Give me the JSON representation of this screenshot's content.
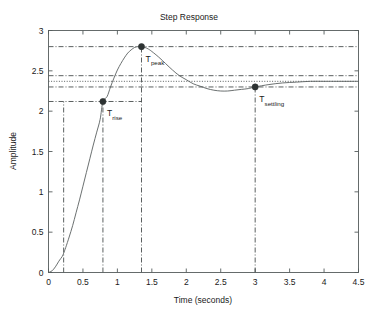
{
  "figure": {
    "title": "Step Response",
    "background": "#ffffff",
    "line_color": "#5a6060",
    "marker_color": "#2d3232",
    "guide_color": "#3c4242"
  },
  "chart_data": {
    "type": "line",
    "title": "Step Response",
    "xlabel": "Time (seconds)",
    "ylabel": "Amplitude",
    "xlim": [
      0,
      4.5
    ],
    "ylim": [
      0,
      3
    ],
    "grid": false,
    "legend": null,
    "xticks": [
      "0",
      "0.5",
      "1",
      "1.5",
      "2",
      "2.5",
      "3",
      "3.5",
      "4",
      "4.5"
    ],
    "xtick_values": [
      0,
      0.5,
      1,
      1.5,
      2,
      2.5,
      3,
      3.5,
      4,
      4.5
    ],
    "yticks": [
      "0",
      "0.5",
      "1",
      "1.5",
      "2",
      "2.5",
      "3"
    ],
    "ytick_values": [
      0,
      0.5,
      1,
      1.5,
      2,
      2.5,
      3
    ],
    "series": [
      {
        "name": "step response",
        "x": [
          0.0,
          0.05,
          0.1,
          0.15,
          0.2,
          0.22,
          0.25,
          0.3,
          0.35,
          0.4,
          0.45,
          0.5,
          0.55,
          0.6,
          0.65,
          0.7,
          0.75,
          0.79,
          0.85,
          0.9,
          0.95,
          1.0,
          1.05,
          1.1,
          1.15,
          1.2,
          1.25,
          1.3,
          1.35,
          1.4,
          1.45,
          1.5,
          1.6,
          1.7,
          1.8,
          1.9,
          2.0,
          2.1,
          2.2,
          2.3,
          2.4,
          2.5,
          2.6,
          2.7,
          2.8,
          2.9,
          3.0,
          3.2,
          3.4,
          3.6,
          3.8,
          4.0,
          4.2,
          4.5
        ],
        "y": [
          0.0,
          0.02,
          0.07,
          0.14,
          0.2,
          0.24,
          0.31,
          0.44,
          0.58,
          0.74,
          0.9,
          1.07,
          1.24,
          1.41,
          1.58,
          1.74,
          1.9,
          2.12,
          2.18,
          2.3,
          2.41,
          2.51,
          2.59,
          2.66,
          2.72,
          2.76,
          2.79,
          2.8,
          2.8,
          2.79,
          2.77,
          2.74,
          2.67,
          2.59,
          2.51,
          2.44,
          2.39,
          2.34,
          2.31,
          2.28,
          2.26,
          2.25,
          2.25,
          2.26,
          2.27,
          2.28,
          2.3,
          2.33,
          2.35,
          2.36,
          2.37,
          2.37,
          2.37,
          2.37
        ]
      }
    ],
    "annotations": [
      {
        "label": "T",
        "subscript": "rise",
        "x": 0.79,
        "y": 2.12,
        "marker": true
      },
      {
        "label": "T",
        "subscript": "peak",
        "x": 1.35,
        "y": 2.8,
        "marker": true
      },
      {
        "label": "T",
        "subscript": "settling",
        "x": 3.0,
        "y": 2.3,
        "marker": true
      }
    ],
    "reference_lines": {
      "vertical": [
        {
          "x": 0.22,
          "style": "dashdot",
          "from_y": 0.0,
          "to_y": 2.12
        },
        {
          "x": 0.79,
          "style": "dashdot",
          "from_y": 0.0,
          "to_y": 2.12
        },
        {
          "x": 1.35,
          "style": "dashdot",
          "from_y": 0.0,
          "to_y": 2.8
        },
        {
          "x": 3.0,
          "style": "dashdot",
          "from_y": 0.0,
          "to_y": 2.3
        }
      ],
      "horizontal": [
        {
          "y": 2.8,
          "style": "dashdot",
          "from_x": 0.0,
          "to_x": 4.5,
          "note": "peak overshoot level"
        },
        {
          "y": 2.44,
          "style": "dashdot",
          "from_x": 0.0,
          "to_x": 4.5,
          "note": "upper settling tolerance band"
        },
        {
          "y": 2.37,
          "style": "dotted",
          "from_x": 0.0,
          "to_x": 4.5,
          "note": "steady-state value"
        },
        {
          "y": 2.3,
          "style": "dashdot",
          "from_x": 0.0,
          "to_x": 4.5,
          "note": "lower settling tolerance band"
        },
        {
          "y": 2.12,
          "style": "dashdot",
          "from_x": 0.0,
          "to_x": 1.35,
          "note": "rise-time level"
        }
      ]
    }
  }
}
